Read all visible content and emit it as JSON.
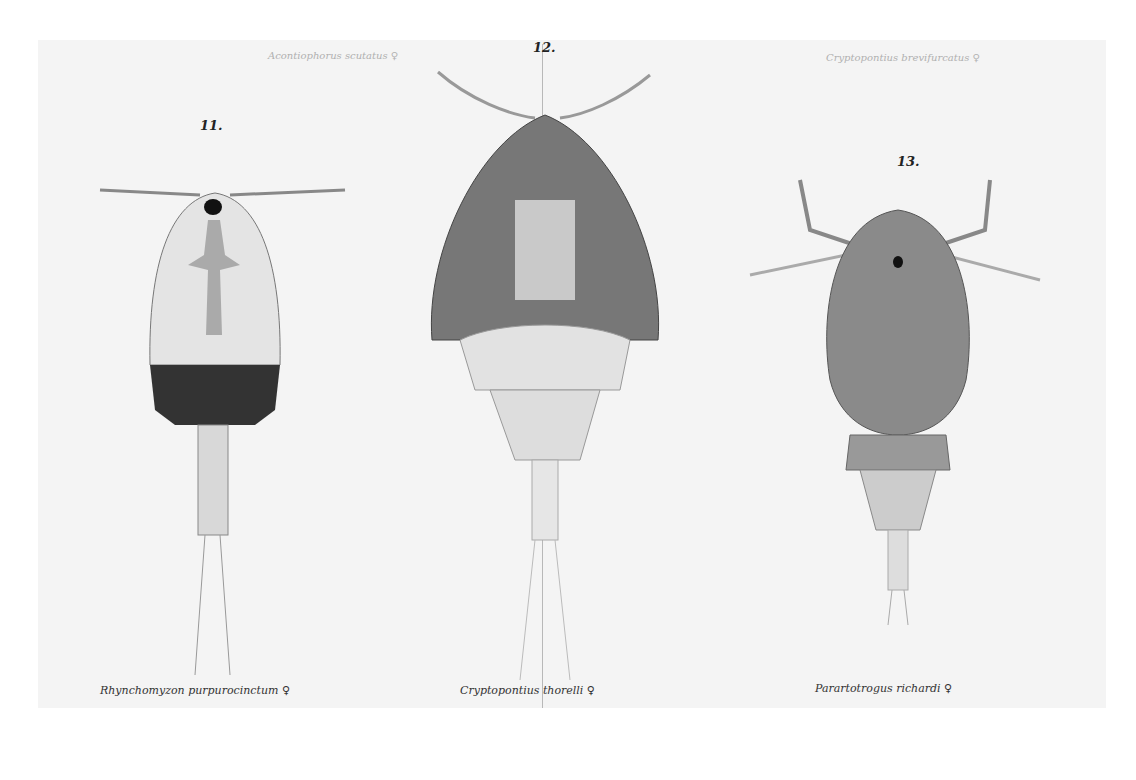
{
  "plate": {
    "figures": [
      {
        "number": "11.",
        "caption": "Rhynchomyzon purpurocinctum ♀"
      },
      {
        "number": "12.",
        "caption": "Cryptopontius thorelli ♀"
      },
      {
        "number": "13.",
        "caption": "Parartotrogus richardi ♀"
      }
    ],
    "faint_labels": [
      "Acontiophorus scutatus ♀",
      "Cryptopontius brevifurcatus ♀"
    ]
  }
}
